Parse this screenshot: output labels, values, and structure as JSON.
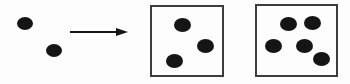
{
  "diagram": {
    "background_color": "#fdfdfd",
    "dot_color": "#151515",
    "box_border_color": "#3d3d3d",
    "loose_dots": {
      "count": 2,
      "dot_size": {
        "width": 16,
        "height": 13
      },
      "centers": [
        {
          "x": 25,
          "y": 23
        },
        {
          "x": 54,
          "y": 50
        }
      ]
    },
    "arrow": {
      "direction": "right",
      "color": "#151515",
      "x1": 70,
      "x2": 128,
      "y": 32,
      "line_thickness": 1.7,
      "head_length": 12,
      "head_width": 9
    },
    "box_dot_size": {
      "width": 17,
      "height": 14
    },
    "boxes": [
      {
        "id": "box-three-dots",
        "dot_count": 3,
        "x": 150,
        "y": 5,
        "width": 74,
        "height": 72,
        "border_width": 2,
        "dot_centers": [
          {
            "x": 32,
            "y": 20
          },
          {
            "x": 55,
            "y": 41
          },
          {
            "x": 24,
            "y": 56
          }
        ]
      },
      {
        "id": "box-five-dots",
        "dot_count": 5,
        "x": 255,
        "y": 4,
        "width": 83,
        "height": 73,
        "border_width": 2,
        "dot_centers": [
          {
            "x": 33,
            "y": 20
          },
          {
            "x": 57,
            "y": 19
          },
          {
            "x": 18,
            "y": 42
          },
          {
            "x": 49,
            "y": 42
          },
          {
            "x": 66,
            "y": 55
          }
        ]
      }
    ]
  }
}
